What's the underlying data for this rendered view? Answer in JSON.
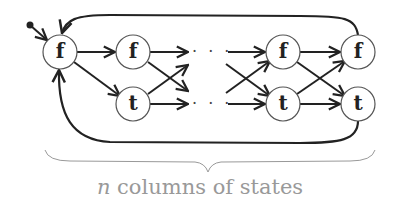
{
  "diagram": {
    "type": "state-machine",
    "start_marker": "initial-state-dot",
    "nodes": [
      {
        "id": "f0",
        "label": "f",
        "column": 0,
        "row": "top"
      },
      {
        "id": "f1",
        "label": "f",
        "column": 1,
        "row": "top"
      },
      {
        "id": "t1",
        "label": "t",
        "column": 1,
        "row": "bottom"
      },
      {
        "id": "fn1",
        "label": "f",
        "column": "n-1",
        "row": "top"
      },
      {
        "id": "tn1",
        "label": "t",
        "column": "n-1",
        "row": "bottom"
      },
      {
        "id": "fn",
        "label": "f",
        "column": "n",
        "row": "top"
      },
      {
        "id": "tn",
        "label": "t",
        "column": "n",
        "row": "bottom"
      }
    ],
    "ellipsis_top": "· · ·",
    "ellipsis_bottom": "· · ·",
    "edges": [
      {
        "from": "start",
        "to": "f0"
      },
      {
        "from": "f0",
        "to": "f1"
      },
      {
        "from": "f0",
        "to": "t1"
      },
      {
        "from": "f1",
        "to": "…top"
      },
      {
        "from": "f1",
        "to": "…bottom"
      },
      {
        "from": "t1",
        "to": "…top"
      },
      {
        "from": "t1",
        "to": "…bottom"
      },
      {
        "from": "…top",
        "to": "fn1"
      },
      {
        "from": "…top",
        "to": "tn1"
      },
      {
        "from": "…bottom",
        "to": "fn1"
      },
      {
        "from": "…bottom",
        "to": "tn1"
      },
      {
        "from": "fn1",
        "to": "fn"
      },
      {
        "from": "fn1",
        "to": "tn"
      },
      {
        "from": "tn1",
        "to": "fn"
      },
      {
        "from": "tn1",
        "to": "tn"
      },
      {
        "from": "fn",
        "to": "f0",
        "style": "loop-over-top"
      },
      {
        "from": "tn",
        "to": "f0",
        "style": "loop-under-bottom"
      }
    ],
    "brace_caption_var": "n",
    "brace_caption_text": " columns of states"
  }
}
